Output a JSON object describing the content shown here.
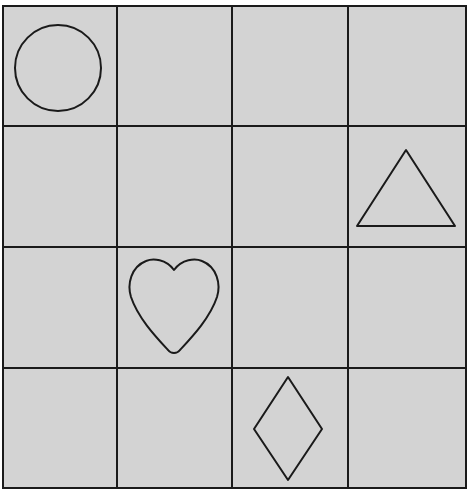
{
  "grid": {
    "rows": 4,
    "cols": 4,
    "left": 3,
    "top": 6,
    "right": 466,
    "bottom": 488,
    "col_lines": [
      117,
      232,
      348
    ],
    "row_lines": [
      126,
      247,
      368
    ],
    "cell_color": "#d3d3d3",
    "line_color": "#1a1a1a"
  },
  "shapes": [
    {
      "name": "circle",
      "row": 0,
      "col": 0
    },
    {
      "name": "triangle",
      "row": 1,
      "col": 3
    },
    {
      "name": "heart",
      "row": 2,
      "col": 1
    },
    {
      "name": "diamond",
      "row": 3,
      "col": 2
    }
  ]
}
